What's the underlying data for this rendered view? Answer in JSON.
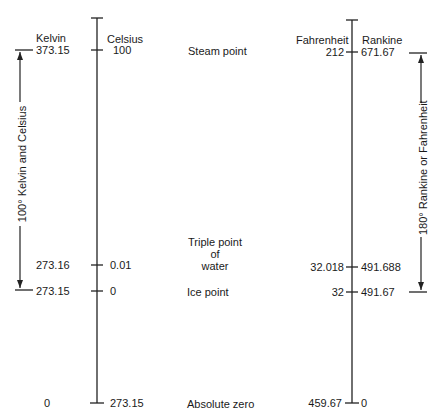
{
  "diagram": {
    "scale_headers": {
      "kelvin": "Kelvin",
      "celsius": "Celsius",
      "fahrenheit": "Fahrenheit",
      "rankine": "Rankine"
    },
    "rows": [
      {
        "name": "Steam point",
        "kelvin": "373.15",
        "celsius": "100",
        "fahrenheit": "212",
        "rankine": "671.67"
      },
      {
        "name_lines": [
          "Triple point",
          "of",
          "water"
        ],
        "kelvin": "273.16",
        "celsius": "0.01",
        "fahrenheit": "32.018",
        "rankine": "491.688"
      },
      {
        "name": "Ice point",
        "kelvin": "273.15",
        "celsius": "0",
        "fahrenheit": "32",
        "rankine": "491.67"
      },
      {
        "name": "Absolute zero",
        "kelvin": "0",
        "celsius": "273.15",
        "fahrenheit": "459.67",
        "rankine": "0"
      }
    ],
    "left_span_label": "100° Kelvin and Celsius",
    "right_span_label": "180° Rankine or Fahrenheit"
  }
}
